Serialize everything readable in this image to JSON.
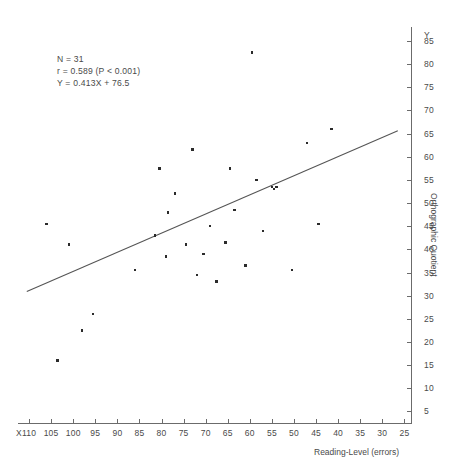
{
  "chart_data": {
    "type": "scatter",
    "title": "",
    "xlabel": "Reading-Level (errors)",
    "ylabel": "Orthographic Quotient",
    "x_axis_name": "X",
    "y_axis_name": "Y",
    "x_ticks": [
      110,
      105,
      100,
      95,
      90,
      85,
      80,
      75,
      70,
      65,
      60,
      55,
      50,
      45,
      40,
      35,
      30,
      25
    ],
    "y_ticks": [
      85,
      80,
      75,
      70,
      65,
      60,
      55,
      50,
      45,
      40,
      35,
      30,
      25,
      20,
      15,
      10,
      5
    ],
    "xlim": [
      112.5,
      23.5
    ],
    "ylim": [
      2.5,
      88.0
    ],
    "x_reversed": true,
    "grid": false,
    "legend": null,
    "n_points": 31,
    "points": [
      {
        "x": 106.0,
        "y": 45.5
      },
      {
        "x": 103.5,
        "y": 16.0
      },
      {
        "x": 101.0,
        "y": 41.0
      },
      {
        "x": 98.0,
        "y": 22.5
      },
      {
        "x": 95.5,
        "y": 26.0
      },
      {
        "x": 86.0,
        "y": 35.5
      },
      {
        "x": 81.5,
        "y": 43.0
      },
      {
        "x": 80.5,
        "y": 57.5
      },
      {
        "x": 79.0,
        "y": 38.5
      },
      {
        "x": 78.5,
        "y": 48.0
      },
      {
        "x": 77.0,
        "y": 52.0
      },
      {
        "x": 74.5,
        "y": 41.0
      },
      {
        "x": 73.0,
        "y": 61.5
      },
      {
        "x": 72.0,
        "y": 34.5
      },
      {
        "x": 70.5,
        "y": 39.0
      },
      {
        "x": 69.0,
        "y": 45.0
      },
      {
        "x": 67.5,
        "y": 33.0
      },
      {
        "x": 65.5,
        "y": 41.5
      },
      {
        "x": 64.5,
        "y": 57.5
      },
      {
        "x": 63.5,
        "y": 48.5
      },
      {
        "x": 61.0,
        "y": 36.5
      },
      {
        "x": 59.5,
        "y": 82.5
      },
      {
        "x": 58.5,
        "y": 55.0
      },
      {
        "x": 57.0,
        "y": 44.0
      },
      {
        "x": 55.0,
        "y": 53.5
      },
      {
        "x": 54.5,
        "y": 53.0
      },
      {
        "x": 54.0,
        "y": 53.5
      },
      {
        "x": 50.5,
        "y": 35.5
      },
      {
        "x": 47.0,
        "y": 63.0
      },
      {
        "x": 44.5,
        "y": 45.5
      },
      {
        "x": 41.5,
        "y": 66.0
      }
    ],
    "regression": {
      "equation": "Y = 0.413X + 76.5",
      "slope": 0.413,
      "intercept": 76.5,
      "x_start": 110.5,
      "x_end": 26.5,
      "y_start": 30.9,
      "y_end": 65.6
    },
    "annotations": {
      "line1": "N = 31",
      "line2": "r = 0.589 (P < 0.001)",
      "line3": "Y = 0.413X + 76.5"
    }
  }
}
